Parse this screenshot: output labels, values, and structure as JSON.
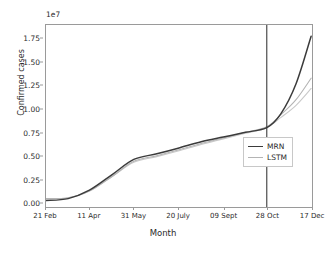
{
  "chart_data": {
    "type": "line",
    "title": "",
    "xlabel": "Month",
    "ylabel": "Confirmed cases",
    "y_offset_text": "1e7",
    "y_offset_multiplier": 10000000,
    "grid": false,
    "legend_position": "center right",
    "xlim": [
      0,
      300
    ],
    "ylim": [
      -0.05,
      1.9
    ],
    "ytick_labels": [
      "0.00",
      "0.25",
      "0.50",
      "0.75",
      "1.00",
      "1.25",
      "1.50",
      "1.75"
    ],
    "ytick_values": [
      0.0,
      0.25,
      0.5,
      0.75,
      1.0,
      1.25,
      1.5,
      1.75
    ],
    "xtick_labels": [
      "21 Feb",
      "11 Apr",
      "31 May",
      "20 July",
      "09 Sept",
      "28 Oct",
      "17 Dec"
    ],
    "xtick_values": [
      0,
      49,
      99,
      149,
      200,
      249,
      299
    ],
    "annotations": [
      {
        "name": "forecast-split-line",
        "type": "vline",
        "x": 249,
        "color": "#3a3a3a"
      }
    ],
    "series": [
      {
        "name": "MRN",
        "color": "#3b3b3b",
        "x": [
          0,
          25,
          49,
          75,
          99,
          125,
          149,
          175,
          200,
          225,
          249,
          265,
          282,
          299
        ],
        "values": [
          0.02,
          0.04,
          0.13,
          0.3,
          0.46,
          0.52,
          0.58,
          0.65,
          0.7,
          0.75,
          0.8,
          0.95,
          1.27,
          1.78
        ]
      },
      {
        "name": "LSTM",
        "color": "#b4b4b4",
        "x": [
          0,
          25,
          49,
          75,
          99,
          125,
          149,
          175,
          200,
          225,
          249,
          265,
          282,
          299
        ],
        "values": [
          0.04,
          0.05,
          0.12,
          0.28,
          0.44,
          0.5,
          0.56,
          0.63,
          0.69,
          0.75,
          0.81,
          0.94,
          1.1,
          1.33
        ]
      },
      {
        "name": "LSTM-lower",
        "color": "#c9c9c9",
        "x": [
          0,
          25,
          49,
          75,
          99,
          125,
          149,
          175,
          200,
          225,
          249,
          265,
          282,
          299
        ],
        "values": [
          0.04,
          0.05,
          0.12,
          0.28,
          0.43,
          0.49,
          0.55,
          0.62,
          0.68,
          0.74,
          0.8,
          0.91,
          1.04,
          1.22
        ]
      }
    ]
  },
  "legend": {
    "entries": [
      {
        "label": "MRN",
        "color": "#3b3b3b"
      },
      {
        "label": "LSTM",
        "color": "#b4b4b4"
      }
    ]
  }
}
